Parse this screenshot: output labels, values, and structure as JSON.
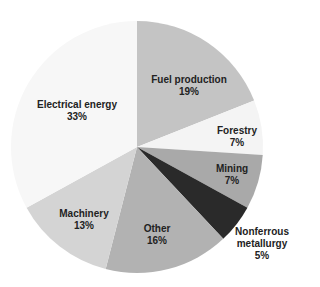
{
  "chart_data": {
    "type": "pie",
    "title": "",
    "start_angle_deg": 0,
    "direction": "clockwise",
    "slices": [
      {
        "label": "Fuel production",
        "value": 19,
        "pct_label": "19%",
        "color": "#c4c4c4"
      },
      {
        "label": "Forestry",
        "value": 7,
        "pct_label": "7%",
        "color": "#f4f4f4"
      },
      {
        "label": "Mining",
        "value": 7,
        "pct_label": "7%",
        "color": "#a9a9a9"
      },
      {
        "label": "Nonferrous metallurgy",
        "value": 5,
        "pct_label": "5%",
        "color": "#2a2a2a"
      },
      {
        "label": "Other",
        "value": 16,
        "pct_label": "16%",
        "color": "#b2b2b2"
      },
      {
        "label": "Machinery",
        "value": 13,
        "pct_label": "13%",
        "color": "#d4d4d4"
      },
      {
        "label": "Electrical energy",
        "value": 33,
        "pct_label": "33%",
        "color": "#f7f7f7"
      }
    ]
  },
  "labels": {
    "fuel": {
      "name": "Fuel production",
      "pct": "19%"
    },
    "forestry": {
      "name": "Forestry",
      "pct": "7%"
    },
    "mining": {
      "name": "Mining",
      "pct": "7%"
    },
    "nonferrous1": "Nonferrous",
    "nonferrous2": "metallurgy",
    "nonferrous_pct": "5%",
    "other": {
      "name": "Other",
      "pct": "16%"
    },
    "machinery": {
      "name": "Machinery",
      "pct": "13%"
    },
    "electrical": {
      "name": "Electrical energy",
      "pct": "33%"
    }
  }
}
